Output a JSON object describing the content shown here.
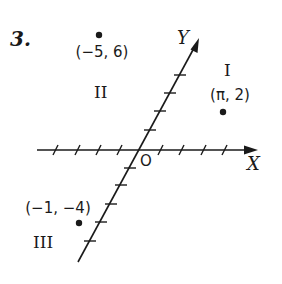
{
  "problem": {
    "number": "3."
  },
  "axes": {
    "x_label": "X",
    "y_label": "Y",
    "origin_label": "O",
    "x_ticks_left": 4,
    "x_ticks_right": 4,
    "y_ticks_up": 4,
    "y_ticks_down": 5,
    "y_axis_oblique": true
  },
  "quadrants": {
    "I": "I",
    "II": "II",
    "III": "III"
  },
  "points": [
    {
      "label": "(−5, 6)",
      "x": -5,
      "y": 6,
      "quadrant": "II"
    },
    {
      "label": "(π, 2)",
      "x": "π",
      "y": 2,
      "quadrant": "I"
    },
    {
      "label": "(−1, −4)",
      "x": -1,
      "y": -4,
      "quadrant": "III"
    }
  ],
  "colors": {
    "ink": "#1a1a1a",
    "background": "#ffffff"
  }
}
